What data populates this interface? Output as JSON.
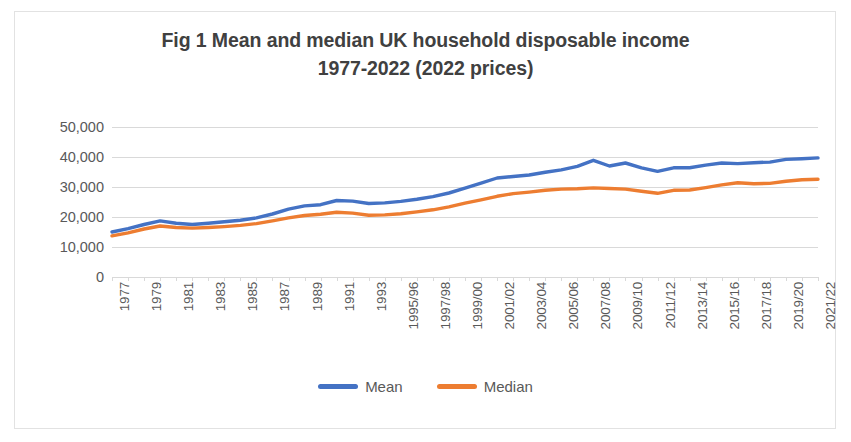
{
  "chart_data": {
    "type": "line",
    "title": "Fig 1 Mean and median UK household disposable income",
    "title_line1": "Fig 1 Mean and median UK household disposable income",
    "title_line2": "1977-2022 (2022 prices)",
    "xlabel": "",
    "ylabel": "",
    "ylim": [
      0,
      50000
    ],
    "yticks": [
      0,
      10000,
      20000,
      30000,
      40000,
      50000
    ],
    "ytick_labels": [
      "0",
      "10,000",
      "20,000",
      "30,000",
      "40,000",
      "50,000"
    ],
    "grid": true,
    "legend_position": "bottom",
    "x": [
      "1977",
      "1978",
      "1979",
      "1980",
      "1981",
      "1982",
      "1983",
      "1984",
      "1985",
      "1986",
      "1987",
      "1988",
      "1989",
      "1990",
      "1991",
      "1992",
      "1993",
      "1994/95",
      "1995/96",
      "1996/97",
      "1997/98",
      "1998/99",
      "1999/00",
      "2000/01",
      "2001/02",
      "2002/03",
      "2003/04",
      "2004/05",
      "2005/06",
      "2006/07",
      "2007/08",
      "2008/09",
      "2009/10",
      "2010/11",
      "2011/12",
      "2012/13",
      "2013/14",
      "2014/15",
      "2015/16",
      "2016/17",
      "2017/18",
      "2018/19",
      "2019/20",
      "2020/21",
      "2021/22"
    ],
    "xtick_labels_shown": [
      "1977",
      "1979",
      "1981",
      "1983",
      "1985",
      "1987",
      "1989",
      "1991",
      "1993",
      "1995/96",
      "1997/98",
      "1999/00",
      "2001/02",
      "2003/04",
      "2005/06",
      "2007/08",
      "2009/10",
      "2011/12",
      "2013/14",
      "2015/16",
      "2017/18",
      "2019/20",
      "2021/22"
    ],
    "series": [
      {
        "name": "Mean",
        "color": "#4472C4",
        "values": [
          15000,
          16100,
          17500,
          18700,
          17900,
          17500,
          17900,
          18400,
          18900,
          19700,
          21000,
          22600,
          23700,
          24100,
          25500,
          25300,
          24500,
          24700,
          25200,
          25900,
          26800,
          28000,
          29600,
          31300,
          33000,
          33500,
          34000,
          34900,
          35700,
          36900,
          38900,
          37000,
          38000,
          36400,
          35200,
          36400,
          36400,
          37300,
          38000,
          37800,
          38100,
          38300,
          39200,
          39400,
          39700
        ]
      },
      {
        "name": "Median",
        "color": "#ED7D31",
        "values": [
          13700,
          14700,
          16000,
          17000,
          16500,
          16300,
          16500,
          16800,
          17200,
          17800,
          18700,
          19700,
          20500,
          20900,
          21600,
          21300,
          20600,
          20700,
          21100,
          21700,
          22400,
          23400,
          24600,
          25700,
          26900,
          27800,
          28300,
          28900,
          29300,
          29400,
          29700,
          29500,
          29300,
          28600,
          27900,
          28900,
          29000,
          29800,
          30700,
          31400,
          31100,
          31200,
          31900,
          32400,
          32600
        ]
      }
    ],
    "legend": [
      {
        "label": "Mean",
        "color": "#4472C4"
      },
      {
        "label": "Median",
        "color": "#ED7D31"
      }
    ]
  }
}
